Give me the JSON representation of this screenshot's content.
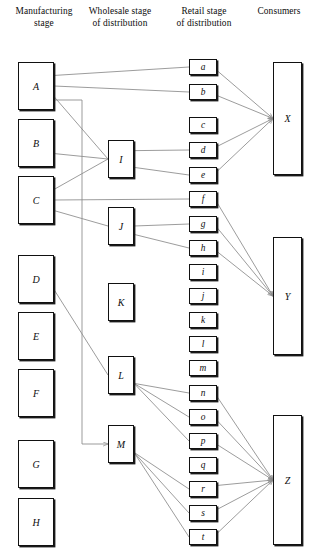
{
  "diagram": {
    "type": "distribution-channel-flow",
    "headers": [
      {
        "id": "h-mfg",
        "line1": "Manufacturing",
        "line2": "stage"
      },
      {
        "id": "h-whl",
        "line1": "Wholesale stage",
        "line2": "of distribution"
      },
      {
        "id": "h-rtl",
        "line1": "Retail stage",
        "line2": "of distribution"
      },
      {
        "id": "h-con",
        "line1": "Consumers",
        "line2": ""
      }
    ],
    "manufacturers": [
      {
        "id": "A",
        "label": "A",
        "x": 18,
        "y": 62,
        "w": 36,
        "h": 48
      },
      {
        "id": "B",
        "label": "B",
        "x": 18,
        "y": 119,
        "w": 36,
        "h": 48
      },
      {
        "id": "C",
        "label": "C",
        "x": 18,
        "y": 176,
        "w": 36,
        "h": 48
      },
      {
        "id": "D",
        "label": "D",
        "x": 18,
        "y": 255,
        "w": 36,
        "h": 48
      },
      {
        "id": "E",
        "label": "E",
        "x": 18,
        "y": 312,
        "w": 36,
        "h": 48
      },
      {
        "id": "F",
        "label": "F",
        "x": 18,
        "y": 369,
        "w": 36,
        "h": 48
      },
      {
        "id": "G",
        "label": "G",
        "x": 18,
        "y": 440,
        "w": 36,
        "h": 48
      },
      {
        "id": "H",
        "label": "H",
        "x": 18,
        "y": 498,
        "w": 36,
        "h": 48
      }
    ],
    "wholesalers": [
      {
        "id": "I",
        "label": "I",
        "x": 108,
        "y": 140,
        "w": 26,
        "h": 38
      },
      {
        "id": "J",
        "label": "J",
        "x": 108,
        "y": 207,
        "w": 26,
        "h": 38
      },
      {
        "id": "K",
        "label": "K",
        "x": 108,
        "y": 283,
        "w": 26,
        "h": 38
      },
      {
        "id": "L",
        "label": "L",
        "x": 108,
        "y": 356,
        "w": 26,
        "h": 38
      },
      {
        "id": "M",
        "label": "M",
        "x": 108,
        "y": 425,
        "w": 26,
        "h": 38
      }
    ],
    "retailers": [
      {
        "id": "a",
        "label": "a",
        "x": 189,
        "y": 59,
        "w": 28,
        "h": 16
      },
      {
        "id": "b",
        "label": "b",
        "x": 189,
        "y": 84,
        "w": 28,
        "h": 16
      },
      {
        "id": "c",
        "label": "c",
        "x": 189,
        "y": 117,
        "w": 28,
        "h": 16
      },
      {
        "id": "d",
        "label": "d",
        "x": 189,
        "y": 142,
        "w": 28,
        "h": 16
      },
      {
        "id": "e",
        "label": "e",
        "x": 189,
        "y": 167,
        "w": 28,
        "h": 16
      },
      {
        "id": "f",
        "label": "f",
        "x": 189,
        "y": 191,
        "w": 28,
        "h": 16
      },
      {
        "id": "g",
        "label": "g",
        "x": 189,
        "y": 216,
        "w": 28,
        "h": 16
      },
      {
        "id": "h",
        "label": "h",
        "x": 189,
        "y": 240,
        "w": 28,
        "h": 16
      },
      {
        "id": "i",
        "label": "i",
        "x": 189,
        "y": 264,
        "w": 28,
        "h": 16
      },
      {
        "id": "j",
        "label": "j",
        "x": 189,
        "y": 288,
        "w": 28,
        "h": 16
      },
      {
        "id": "k",
        "label": "k",
        "x": 189,
        "y": 312,
        "w": 28,
        "h": 16
      },
      {
        "id": "l",
        "label": "l",
        "x": 189,
        "y": 336,
        "w": 28,
        "h": 16
      },
      {
        "id": "m",
        "label": "m",
        "x": 189,
        "y": 360,
        "w": 28,
        "h": 16
      },
      {
        "id": "n",
        "label": "n",
        "x": 189,
        "y": 385,
        "w": 28,
        "h": 16
      },
      {
        "id": "o",
        "label": "o",
        "x": 189,
        "y": 409,
        "w": 28,
        "h": 16
      },
      {
        "id": "p",
        "label": "p",
        "x": 189,
        "y": 433,
        "w": 28,
        "h": 16
      },
      {
        "id": "q",
        "label": "q",
        "x": 189,
        "y": 457,
        "w": 28,
        "h": 16
      },
      {
        "id": "r",
        "label": "r",
        "x": 189,
        "y": 481,
        "w": 28,
        "h": 16
      },
      {
        "id": "s",
        "label": "s",
        "x": 189,
        "y": 505,
        "w": 28,
        "h": 16
      },
      {
        "id": "t",
        "label": "t",
        "x": 189,
        "y": 529,
        "w": 28,
        "h": 16
      }
    ],
    "consumers": [
      {
        "id": "X",
        "label": "X",
        "x": 273,
        "y": 62,
        "w": 29,
        "h": 113
      },
      {
        "id": "Y",
        "label": "Y",
        "x": 273,
        "y": 237,
        "w": 29,
        "h": 118
      },
      {
        "id": "Z",
        "label": "Z",
        "x": 273,
        "y": 415,
        "w": 29,
        "h": 130
      }
    ],
    "links": [
      {
        "from": "A",
        "to": "a"
      },
      {
        "from": "A",
        "to": "b"
      },
      {
        "from": "A",
        "to": "I"
      },
      {
        "from": "A",
        "to": "M"
      },
      {
        "from": "B",
        "to": "I"
      },
      {
        "from": "C",
        "to": "I"
      },
      {
        "from": "C",
        "to": "f"
      },
      {
        "from": "C",
        "to": "J"
      },
      {
        "from": "D",
        "to": "L"
      },
      {
        "from": "I",
        "to": "d"
      },
      {
        "from": "I",
        "to": "e"
      },
      {
        "from": "J",
        "to": "g"
      },
      {
        "from": "J",
        "to": "h"
      },
      {
        "from": "L",
        "to": "n"
      },
      {
        "from": "L",
        "to": "o"
      },
      {
        "from": "L",
        "to": "p"
      },
      {
        "from": "M",
        "to": "r"
      },
      {
        "from": "M",
        "to": "s"
      },
      {
        "from": "M",
        "to": "t"
      },
      {
        "from": "a",
        "to": "X"
      },
      {
        "from": "b",
        "to": "X"
      },
      {
        "from": "d",
        "to": "X"
      },
      {
        "from": "e",
        "to": "X"
      },
      {
        "from": "f",
        "to": "Y"
      },
      {
        "from": "g",
        "to": "Y"
      },
      {
        "from": "h",
        "to": "Y"
      },
      {
        "from": "n",
        "to": "Z"
      },
      {
        "from": "o",
        "to": "Z"
      },
      {
        "from": "p",
        "to": "Z"
      },
      {
        "from": "r",
        "to": "Z"
      },
      {
        "from": "s",
        "to": "Z"
      },
      {
        "from": "t",
        "to": "Z"
      }
    ],
    "colors": {
      "line": "#8a8a8a",
      "box_border": "#111111",
      "shadow": "#1a1a1a",
      "text": "#0d0d0d"
    }
  }
}
